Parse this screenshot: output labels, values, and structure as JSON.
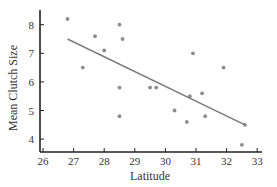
{
  "chart_data": {
    "type": "scatter",
    "title": "",
    "xlabel": "Latitude",
    "ylabel": "Mean Clutch Size",
    "xlim": [
      25.9,
      33.1
    ],
    "ylim": [
      3.5,
      8.5
    ],
    "xticks": [
      26,
      27,
      28,
      29,
      30,
      31,
      32,
      33
    ],
    "yticks": [
      4,
      5,
      6,
      7,
      8
    ],
    "grid": false,
    "legend": null,
    "series": [
      {
        "name": "Observations",
        "points": [
          {
            "x": 26.8,
            "y": 8.2
          },
          {
            "x": 27.3,
            "y": 6.5
          },
          {
            "x": 27.7,
            "y": 7.6
          },
          {
            "x": 28.0,
            "y": 7.1
          },
          {
            "x": 28.5,
            "y": 8.0
          },
          {
            "x": 28.6,
            "y": 7.5
          },
          {
            "x": 28.5,
            "y": 5.8
          },
          {
            "x": 28.5,
            "y": 4.8
          },
          {
            "x": 29.5,
            "y": 5.8
          },
          {
            "x": 29.7,
            "y": 5.8
          },
          {
            "x": 30.3,
            "y": 5.0
          },
          {
            "x": 30.7,
            "y": 4.6
          },
          {
            "x": 30.8,
            "y": 5.5
          },
          {
            "x": 30.9,
            "y": 7.0
          },
          {
            "x": 31.2,
            "y": 5.6
          },
          {
            "x": 31.3,
            "y": 4.8
          },
          {
            "x": 31.9,
            "y": 6.5
          },
          {
            "x": 32.5,
            "y": 3.8
          },
          {
            "x": 32.6,
            "y": 4.5
          }
        ]
      }
    ],
    "regression_line": {
      "x1": 26.8,
      "y1": 7.5,
      "x2": 32.6,
      "y2": 4.5
    },
    "colors": {
      "point": "#8c8c8c",
      "line": "#7a7a7a",
      "axis": "#222222",
      "text": "#333333"
    }
  }
}
